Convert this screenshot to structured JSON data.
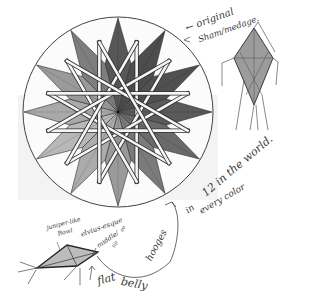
{
  "sketch": {
    "medium": "pencil",
    "colors": {
      "paper": "#ffffff",
      "paper_shade": "#f3f3f3",
      "line": "#2e2e2e",
      "dark": "#4a4a4a",
      "mid_dark": "#5e5e5e",
      "mid": "#8a8a8a",
      "light": "#b4b4b4",
      "lighter": "#cfcfcf",
      "band": "#f6f6f6"
    },
    "mandala": {
      "points": 12,
      "shading": [
        "#575757",
        "#4d4d4d",
        "#505050",
        "#5a5a5a",
        "#6a6a6a",
        "#7b7b7b",
        "#9a9a9a",
        "#acacac",
        "#b8b8b8",
        "#a9a9a9",
        "#9a9a9a",
        "#7e7e7e"
      ]
    },
    "annotations": {
      "original_1": "← original",
      "original_2": "Sham/medage.",
      "world": "12 in the world.",
      "color_in": "in",
      "color_every": "every color",
      "hooges": "hooges",
      "flat": "flat",
      "belly": "belly",
      "juniper": "juniper-like",
      "juniper_2": "Bowl",
      "elvius": "elvius-esque",
      "middle": "middle/",
      "middle_2": "oo",
      "middle_3": "tip"
    }
  }
}
